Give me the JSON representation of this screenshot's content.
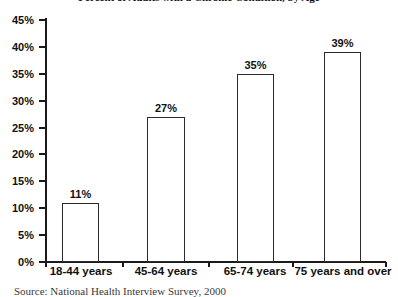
{
  "chart_data": {
    "type": "bar",
    "title": "Percent of Adults with a Chronic Condition, by Age",
    "subtitle": "",
    "xlabel": "",
    "ylabel": "",
    "categories": [
      "18-44 years",
      "45-64 years",
      "65-74 years",
      "75 years and over"
    ],
    "values": [
      11,
      27,
      35,
      39
    ],
    "value_labels": [
      "11%",
      "27%",
      "35%",
      "39%"
    ],
    "ylim": [
      0,
      45
    ],
    "ytick_values": [
      0,
      5,
      10,
      15,
      20,
      25,
      30,
      35,
      40,
      45
    ],
    "ytick_labels": [
      "0%",
      "5%",
      "10%",
      "15%",
      "20%",
      "25%",
      "30%",
      "35%",
      "40%",
      "45%"
    ],
    "grid": false,
    "legend": null,
    "bar_fill_color": "#ffffff",
    "bar_edge_color": "#2b2b2b",
    "axis_color": "#1a1a1a",
    "text_color": "#111111"
  },
  "source": {
    "note": "Source: National Health Interview Survey, 2000"
  }
}
